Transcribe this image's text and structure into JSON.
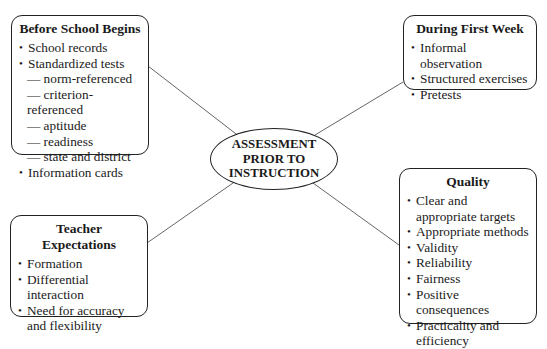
{
  "center": {
    "lines": [
      "ASSESSMENT",
      "PRIOR TO",
      "INSTRUCTION"
    ]
  },
  "boxes": {
    "before_school": {
      "title": "Before School Begins",
      "items": [
        {
          "text": "School records",
          "type": "bullet"
        },
        {
          "text": "Standardized tests",
          "type": "bullet"
        },
        {
          "text": "— norm-referenced",
          "type": "sub"
        },
        {
          "text": "— criterion-referenced",
          "type": "sub"
        },
        {
          "text": "— aptitude",
          "type": "sub"
        },
        {
          "text": "— readiness",
          "type": "sub"
        },
        {
          "text": "— state and district",
          "type": "sub"
        },
        {
          "text": "Information cards",
          "type": "bullet"
        }
      ]
    },
    "first_week": {
      "title": "During First Week",
      "items": [
        {
          "text": "Informal observation",
          "type": "bullet"
        },
        {
          "text": "Structured exercises",
          "type": "bullet"
        },
        {
          "text": "Pretests",
          "type": "bullet"
        }
      ]
    },
    "quality": {
      "title": "Quality",
      "items": [
        {
          "text": "Clear and appropriate targets",
          "type": "bullet"
        },
        {
          "text": "Appropriate methods",
          "type": "bullet"
        },
        {
          "text": "Validity",
          "type": "bullet"
        },
        {
          "text": "Reliability",
          "type": "bullet"
        },
        {
          "text": "Fairness",
          "type": "bullet"
        },
        {
          "text": "Positive consequences",
          "type": "bullet"
        },
        {
          "text": "Practicality and efficiency",
          "type": "bullet"
        }
      ]
    },
    "teacher_expectations": {
      "title_lines": [
        "Teacher",
        "Expectations"
      ],
      "items": [
        {
          "text": "Formation",
          "type": "bullet"
        },
        {
          "text": "Differential interaction",
          "type": "bullet"
        },
        {
          "text": "Need for accuracy and flexibility",
          "type": "bullet"
        }
      ]
    }
  },
  "colors": {
    "border": "#222222",
    "connector": "#666666",
    "background": "#ffffff"
  }
}
